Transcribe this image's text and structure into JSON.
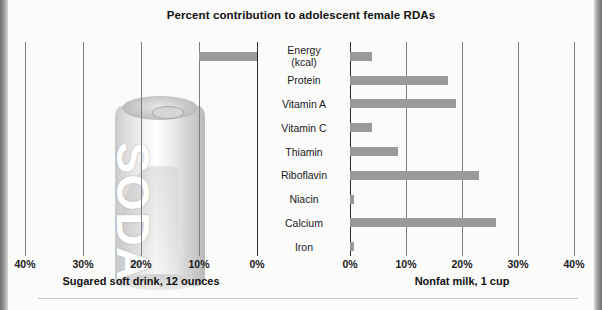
{
  "chart_data": {
    "type": "bar",
    "title": "Percent contribution to adolescent female RDAs",
    "orientation": "horizontal-diverging",
    "categories": [
      "Energy (kcal)",
      "Protein",
      "Vitamin A",
      "Vitamin C",
      "Thiamin",
      "Riboflavin",
      "Niacin",
      "Calcium",
      "Iron"
    ],
    "category_lines": [
      [
        "Energy",
        "(kcal)"
      ],
      [
        "Protein"
      ],
      [
        "Vitamin A"
      ],
      [
        "Vitamin C"
      ],
      [
        "Thiamin"
      ],
      [
        "Riboflavin"
      ],
      [
        "Niacin"
      ],
      [
        "Calcium"
      ],
      [
        "Iron"
      ]
    ],
    "xlabel": "",
    "ylabel": "",
    "grid": true,
    "series": [
      {
        "name": "Sugared soft drink, 12 ounces",
        "side": "left",
        "axis_ticks": [
          40,
          30,
          20,
          10,
          0
        ],
        "axis_tick_labels": [
          "40%",
          "30%",
          "20%",
          "10%",
          "0%"
        ],
        "xlim": [
          0,
          40
        ],
        "values": [
          10,
          0,
          0,
          0,
          0,
          0,
          0,
          0,
          0
        ]
      },
      {
        "name": "Nonfat milk, 1 cup",
        "side": "right",
        "axis_ticks": [
          0,
          10,
          20,
          30,
          40
        ],
        "axis_tick_labels": [
          "0%",
          "10%",
          "20%",
          "30%",
          "40%"
        ],
        "xlim": [
          0,
          40
        ],
        "values": [
          4,
          17.5,
          19,
          4,
          8.5,
          23,
          0.7,
          26,
          0.8
        ]
      }
    ],
    "bar_color": "#9a9a9a"
  },
  "artwork": {
    "soda_can_label": "SODA",
    "soda_can_name": "soda-can-illustration",
    "milk_glass_name": "milk-glass-illustration"
  },
  "footers": {
    "left": "Sugared soft drink, 12 ounces",
    "right": "Nonfat milk, 1 cup"
  }
}
